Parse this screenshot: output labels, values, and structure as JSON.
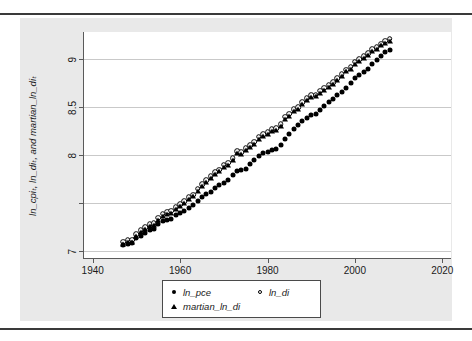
{
  "chart_data": {
    "type": "scatter",
    "title": "",
    "xlabel": "Year",
    "ylabel": "ln_cpiₜ, ln_diₜ, and martian_ln_diₜ",
    "xlim": [
      1938,
      2022
    ],
    "ylim": [
      6.93,
      9.28
    ],
    "xticks": [
      1940,
      1960,
      1980,
      2000,
      2020
    ],
    "xtick_labels": [
      "1940",
      "1960",
      "1980",
      "2000",
      "2020"
    ],
    "yticks": [
      7,
      7.5,
      8,
      8.5,
      9
    ],
    "ytick_labels": [
      "7",
      "",
      "8",
      "8.5",
      "9"
    ],
    "grid": true,
    "grid_axis": "y",
    "legend_position": "below-center",
    "x": [
      1947,
      1948,
      1949,
      1950,
      1951,
      1952,
      1953,
      1954,
      1955,
      1956,
      1957,
      1958,
      1959,
      1960,
      1961,
      1962,
      1963,
      1964,
      1965,
      1966,
      1967,
      1968,
      1969,
      1970,
      1971,
      1972,
      1973,
      1974,
      1975,
      1976,
      1977,
      1978,
      1979,
      1980,
      1981,
      1982,
      1983,
      1984,
      1985,
      1986,
      1987,
      1988,
      1989,
      1990,
      1991,
      1992,
      1993,
      1994,
      1995,
      1996,
      1997,
      1998,
      1999,
      2000,
      2001,
      2002,
      2003,
      2004,
      2005,
      2006,
      2007,
      2008
    ],
    "series": [
      {
        "name": "ln_pce",
        "marker": "filled-circle",
        "color": "#000000",
        "values": [
          7.06,
          7.08,
          7.09,
          7.14,
          7.16,
          7.19,
          7.22,
          7.23,
          7.28,
          7.31,
          7.33,
          7.34,
          7.38,
          7.4,
          7.42,
          7.45,
          7.48,
          7.52,
          7.56,
          7.6,
          7.62,
          7.66,
          7.69,
          7.71,
          7.74,
          7.79,
          7.83,
          7.84,
          7.86,
          7.91,
          7.95,
          7.99,
          8.02,
          8.03,
          8.05,
          8.06,
          8.11,
          8.17,
          8.22,
          8.27,
          8.31,
          8.35,
          8.39,
          8.42,
          8.43,
          8.47,
          8.51,
          8.55,
          8.58,
          8.62,
          8.66,
          8.7,
          8.75,
          8.8,
          8.83,
          8.86,
          8.9,
          8.95,
          8.99,
          9.03,
          9.07,
          9.09
        ]
      },
      {
        "name": "ln_di",
        "marker": "open-circle",
        "color": "#000000",
        "values": [
          7.1,
          7.12,
          7.12,
          7.18,
          7.22,
          7.25,
          7.28,
          7.29,
          7.35,
          7.39,
          7.41,
          7.42,
          7.46,
          7.49,
          7.52,
          7.56,
          7.59,
          7.65,
          7.7,
          7.74,
          7.78,
          7.82,
          7.85,
          7.9,
          7.92,
          7.97,
          8.04,
          8.03,
          8.07,
          8.1,
          8.14,
          8.19,
          8.22,
          8.24,
          8.27,
          8.28,
          8.32,
          8.4,
          8.43,
          8.48,
          8.5,
          8.55,
          8.59,
          8.62,
          8.63,
          8.67,
          8.7,
          8.73,
          8.76,
          8.8,
          8.84,
          8.89,
          8.92,
          8.97,
          9.0,
          9.03,
          9.06,
          9.1,
          9.12,
          9.16,
          9.19,
          9.21
        ]
      },
      {
        "name": "martian_ln_di",
        "marker": "filled-triangle",
        "color": "#000000",
        "values": [
          7.08,
          7.1,
          7.1,
          7.16,
          7.2,
          7.23,
          7.26,
          7.27,
          7.33,
          7.37,
          7.39,
          7.4,
          7.44,
          7.47,
          7.5,
          7.54,
          7.57,
          7.63,
          7.68,
          7.72,
          7.76,
          7.8,
          7.83,
          7.88,
          7.9,
          7.95,
          8.02,
          8.01,
          8.05,
          8.08,
          8.12,
          8.17,
          8.2,
          8.22,
          8.25,
          8.26,
          8.3,
          8.38,
          8.41,
          8.46,
          8.48,
          8.53,
          8.57,
          8.6,
          8.61,
          8.65,
          8.68,
          8.71,
          8.74,
          8.78,
          8.82,
          8.87,
          8.9,
          8.95,
          8.98,
          9.01,
          9.04,
          9.08,
          9.1,
          9.14,
          9.17,
          9.19
        ]
      }
    ]
  },
  "axes": {
    "x_title": "Year",
    "y_title": "ln_cpiₜ, ln_diₜ, and martian_ln_diₜ"
  },
  "legend": {
    "entries": [
      {
        "label": "ln_pce",
        "marker": "filled-circle"
      },
      {
        "label": "ln_di",
        "marker": "open-circle"
      },
      {
        "label": "martian_ln_di",
        "marker": "filled-triangle"
      }
    ]
  }
}
